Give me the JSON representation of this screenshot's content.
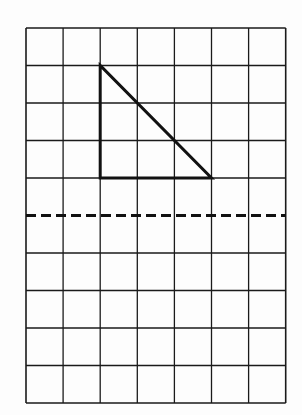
{
  "diagram": {
    "type": "grid-with-triangle",
    "grid": {
      "columns": 7,
      "rows": 10,
      "origin_px": [
        26,
        28
      ],
      "cell_width_px": 37.1,
      "cell_height_px": 37.5,
      "line_color": "#1a1a1a"
    },
    "triangle": {
      "vertices_grid": [
        [
          2,
          1
        ],
        [
          2,
          4
        ],
        [
          5,
          4
        ]
      ],
      "stroke_color": "#111111",
      "stroke_width": 3
    },
    "dashed_line": {
      "row_index": 5,
      "stroke_color": "#111111",
      "stroke_width": 3,
      "dash": [
        10,
        5
      ]
    }
  }
}
